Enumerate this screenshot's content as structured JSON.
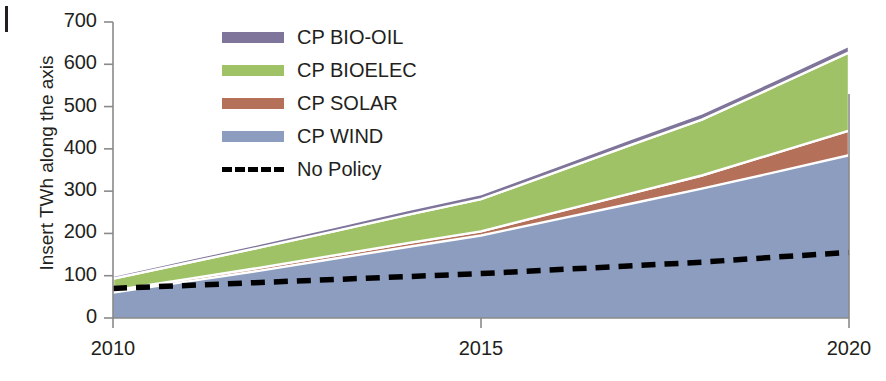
{
  "chart_data": {
    "type": "area",
    "stacked": true,
    "title": "",
    "xlabel": "",
    "ylabel": "Insert TWh along the axis",
    "xlim": [
      2010,
      2020
    ],
    "ylim": [
      0,
      700
    ],
    "x_ticks": [
      "2010",
      "2015",
      "2020"
    ],
    "x_tick_values": [
      2010,
      2015,
      2020
    ],
    "y_ticks": [
      "0",
      "100",
      "200",
      "300",
      "400",
      "500",
      "600",
      "700"
    ],
    "y_tick_values": [
      0,
      100,
      200,
      300,
      400,
      500,
      600,
      700
    ],
    "grid": false,
    "legend_position": "upper left inside",
    "x": [
      2010,
      2011,
      2012,
      2013,
      2014,
      2015,
      2016,
      2017,
      2018,
      2019,
      2020
    ],
    "series": [
      {
        "name": "CP WIND",
        "color": "#8c9dc0",
        "kind": "area",
        "values": [
          60,
          86,
          112,
          140,
          168,
          195,
          232,
          269,
          306,
          345,
          385
        ]
      },
      {
        "name": "CP SOLAR",
        "color": "#b5705a",
        "kind": "area",
        "values": [
          5,
          6,
          7,
          8,
          9,
          10,
          17,
          24,
          31,
          45,
          58
        ]
      },
      {
        "name": "CP BIOELEC",
        "color": "#a0c267",
        "kind": "area",
        "values": [
          28,
          38,
          48,
          57,
          67,
          76,
          95,
          114,
          132,
          158,
          185
        ]
      },
      {
        "name": "CP BIO-OIL",
        "color": "#7f7499",
        "kind": "area",
        "values": [
          7,
          8,
          9,
          10,
          11,
          12,
          13,
          14,
          15,
          15,
          16
        ]
      },
      {
        "name": "No Policy",
        "color": "#000000",
        "kind": "line",
        "style": "dashed",
        "values": [
          70,
          77,
          84,
          91,
          98,
          105,
          114,
          123,
          132,
          144,
          155
        ]
      }
    ]
  },
  "legend": {
    "items": [
      {
        "label": "CP BIO-OIL",
        "color": "#7f7499",
        "marker": "swatch"
      },
      {
        "label": "CP BIOELEC",
        "color": "#a0c267",
        "marker": "swatch"
      },
      {
        "label": "CP SOLAR",
        "color": "#b5705a",
        "marker": "swatch"
      },
      {
        "label": "CP WIND",
        "color": "#8c9dc0",
        "marker": "swatch"
      },
      {
        "label": "No Policy",
        "color": "#000000",
        "marker": "dashed-line"
      }
    ]
  },
  "axes": {
    "y_title": "Insert TWh along the axis",
    "y_labels": [
      "700",
      "600",
      "500",
      "400",
      "300",
      "200",
      "100",
      "0"
    ],
    "x_labels": [
      "2010",
      "2015",
      "2020"
    ]
  }
}
